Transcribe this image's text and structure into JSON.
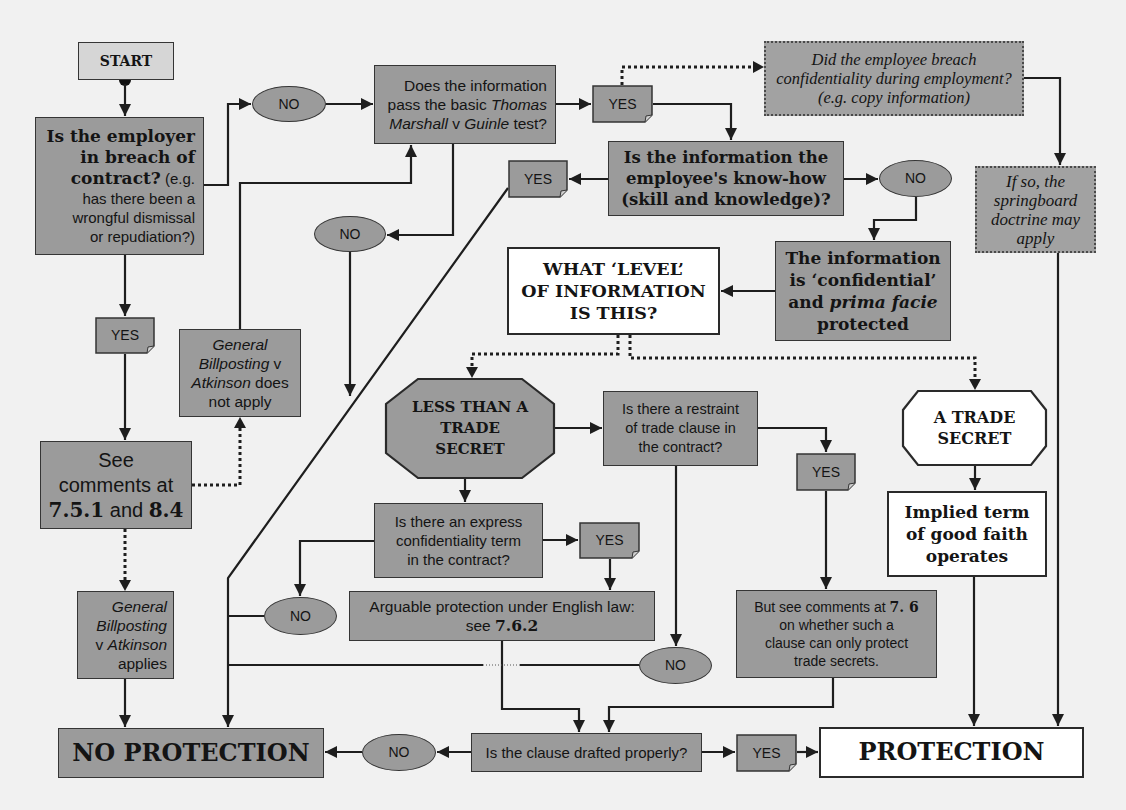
{
  "colors": {
    "background": "#f1f1f1",
    "box_fill": "#9b9b9b",
    "start_fill": "#d6d6d6",
    "outcome_fill": "#ffffff",
    "border": "#353535",
    "connector": "#1e1e1e"
  },
  "nodes": {
    "start": {
      "label": "START"
    },
    "employer": {
      "bold": "Is the employer\nin breach of\ncontract?",
      "text": " (e.g.\nhas there been a\nwrongful dismissal\nor repudiation?)"
    },
    "no_employer": {
      "label": "NO"
    },
    "thomas_marshall": {
      "t1": "Does the information\npass the basic ",
      "i1": "Thomas\nMarshall",
      "t2": " v ",
      "i2": "Guinle",
      "t3": " test?"
    },
    "yes_thomas": {
      "label": "YES"
    },
    "did_employee": {
      "text": "Did the employee breach\nconfidentiality during employment?\n(e.g. copy information)"
    },
    "springboard": {
      "text": "If so, the\nspringboard\ndoctrine may\napply"
    },
    "knowhow": {
      "text": "Is the information the\nemployee's know-how\n(skill and knowledge)?"
    },
    "yes_knowhow": {
      "label": "YES"
    },
    "no_knowhow": {
      "label": "NO"
    },
    "no_thomas": {
      "label": "NO"
    },
    "confidential": {
      "b1": "The information\nis ‘confidential’\nand ",
      "bi": "prima facie",
      "b2": "\nprotected"
    },
    "what_level": {
      "text": "WHAT ‘LEVEL’\nOF INFORMATION\nIS THIS?"
    },
    "yes_employer": {
      "label": "YES"
    },
    "gb_not_apply": {
      "i1": "General\nBillposting",
      "t1": " v\n",
      "i2": "Atkinson",
      "t2": " does\nnot apply"
    },
    "see_comments": {
      "t1": "See\ncomments at\n",
      "b1": "7.5.1",
      "t2": " and ",
      "b2": "8.4"
    },
    "gb_applies": {
      "i1": "General\nBillposting",
      "t1": "\nv ",
      "i2": "Atkinson",
      "t2": "\napplies"
    },
    "less_than": {
      "text": "LESS THAN A\nTRADE\nSECRET"
    },
    "restraint": {
      "text": "Is there a restraint\nof trade clause in\nthe contract?"
    },
    "yes_restraint": {
      "label": "YES"
    },
    "trade_secret": {
      "text": "A TRADE\nSECRET"
    },
    "implied": {
      "text": "Implied term\nof good faith\noperates"
    },
    "express": {
      "text": "Is there an express\nconfidentiality term\nin the contract?"
    },
    "yes_express": {
      "label": "YES"
    },
    "no_express": {
      "label": "NO"
    },
    "arguable": {
      "t1": "Arguable protection under English law:\nsee ",
      "b1": "7.6.2"
    },
    "but_see": {
      "t1": "But see comments at ",
      "b1": "7. 6",
      "t2": "\non whether such a\nclause can only protect\ntrade secrets."
    },
    "no_restraint": {
      "label": "NO"
    },
    "no_protection": {
      "label": "NO PROTECTION"
    },
    "no_clause": {
      "label": "NO"
    },
    "clause": {
      "text": "Is the clause drafted properly?"
    },
    "yes_clause": {
      "label": "YES"
    },
    "protection": {
      "label": "PROTECTION"
    }
  }
}
